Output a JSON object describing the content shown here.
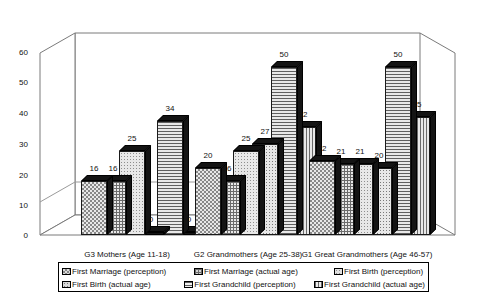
{
  "chart_data": {
    "type": "bar",
    "title": "",
    "xlabel": "",
    "ylabel": "",
    "ylim": [
      0,
      60
    ],
    "yticks": [
      0,
      10,
      20,
      30,
      40,
      50,
      60
    ],
    "grid": false,
    "legend_position": "bottom",
    "style": "3d-clustered-column",
    "categories": [
      "G3 Mothers (Age 11-18)",
      "G2 Grandmothers (Age 25-38)",
      "G1 Great Grandmothers (Age 46-57)"
    ],
    "series": [
      {
        "name": "First Marriage (perception)",
        "pattern": "checkerboard",
        "values": [
          16,
          20,
          22
        ]
      },
      {
        "name": "First Marriage (actual age)",
        "pattern": "fine-grid",
        "values": [
          16,
          16,
          21
        ]
      },
      {
        "name": "First Birth (perception)",
        "pattern": "light-dots",
        "values": [
          25,
          25,
          21
        ]
      },
      {
        "name": "First Birth (actual age)",
        "pattern": "medium-dots",
        "values": [
          0,
          27,
          20
        ]
      },
      {
        "name": "First Grandchild (perception)",
        "pattern": "horizontal-lines",
        "values": [
          34,
          50,
          50
        ]
      },
      {
        "name": "First Grandchild (actual age)",
        "pattern": "vertical-lines",
        "values": [
          0,
          32,
          35
        ]
      }
    ]
  },
  "legend": {
    "items": [
      {
        "label": "First Marriage (perception)",
        "swatch": "checkerboard-swatch"
      },
      {
        "label": "First Marriage (actual age)",
        "swatch": "fine-grid-swatch"
      },
      {
        "label": "First Birth (perception)",
        "swatch": "light-dots-swatch"
      },
      {
        "label": "First Birth (actual age)",
        "swatch": "medium-dots-swatch"
      },
      {
        "label": "First Grandchild (perception)",
        "swatch": "horizontal-lines-swatch"
      },
      {
        "label": "First Grandchild (actual age)",
        "swatch": "vertical-lines-swatch"
      }
    ]
  },
  "axis": {
    "y_tick_labels": [
      "60",
      "50",
      "40",
      "30",
      "20",
      "10",
      "0"
    ]
  },
  "value_labels": {
    "g3": [
      "16",
      "16",
      "25",
      "0",
      "34",
      "0"
    ],
    "g2": [
      "20",
      "16",
      "25",
      "27",
      "50",
      "32"
    ],
    "g1": [
      "22",
      "21",
      "21",
      "20",
      "50",
      "35"
    ]
  },
  "colors": {
    "background": "#ffffff",
    "axis_line": "#6e6e6e",
    "bar_outline": "#1a1a1a",
    "bar_shadow": "#141414",
    "text": "#111111"
  }
}
